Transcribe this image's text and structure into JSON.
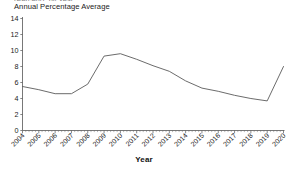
{
  "figure": {
    "clipped_top_text": "(Percent), by Year",
    "ylabel_text": "Annual Percentage Average",
    "xlabel_text": "Year"
  },
  "chart_data": {
    "type": "line",
    "title": "",
    "subtitle": "",
    "xlabel": "Year",
    "ylabel": "Annual Percentage Average",
    "categories": [
      "2004",
      "2005",
      "2006",
      "2007",
      "2008",
      "2009",
      "2010",
      "2011",
      "2012",
      "2013",
      "2014",
      "2015",
      "2016",
      "2017",
      "2018",
      "2019",
      "2020"
    ],
    "x": [
      2004,
      2005,
      2006,
      2007,
      2008,
      2009,
      2010,
      2011,
      2012,
      2013,
      2014,
      2015,
      2016,
      2017,
      2018,
      2019,
      2020
    ],
    "values": [
      5.5,
      5.1,
      4.6,
      4.6,
      5.8,
      9.3,
      9.6,
      8.9,
      8.1,
      7.4,
      6.2,
      5.3,
      4.9,
      4.4,
      4.0,
      3.7,
      8.0
    ],
    "series": [
      {
        "name": "Annual Percentage Average",
        "values": [
          5.5,
          5.1,
          4.6,
          4.6,
          5.8,
          9.3,
          9.6,
          8.9,
          8.1,
          7.4,
          6.2,
          5.3,
          4.9,
          4.4,
          4.0,
          3.7,
          8.0
        ],
        "color": "#5a5a5a"
      }
    ],
    "ylim": [
      0,
      14
    ],
    "yticks": [
      0,
      2,
      4,
      6,
      8,
      10,
      12,
      14
    ],
    "ytick_labels": [
      "0",
      "2",
      "4",
      "6",
      "8",
      "10",
      "12",
      "14"
    ],
    "xlim": [
      2004,
      2020
    ],
    "xtick_labels": [
      "2004",
      "2005",
      "2006",
      "2007",
      "2008",
      "2009",
      "2010",
      "2011",
      "2012",
      "2013",
      "2014",
      "2015",
      "2016",
      "2017",
      "2018",
      "2019",
      "2020"
    ],
    "grid": false,
    "legend": false,
    "legend_position": "none",
    "line_color": "#5a5a5a",
    "axis_color": "#555555",
    "minor_ticks_per_interval": 4
  }
}
